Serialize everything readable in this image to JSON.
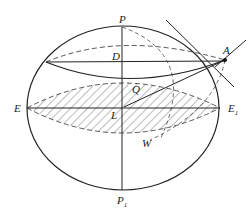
{
  "diagram": {
    "type": "geometry-sphere-section",
    "colors": {
      "stroke": "#222222",
      "hatch": "#555555",
      "background": "#ffffff"
    },
    "labels": {
      "P": "P",
      "P1_main": "P",
      "P1_sub": "1",
      "E": "E",
      "E1_main": "E",
      "E1_sub": "1",
      "A": "A",
      "D": "D",
      "Q": "Q",
      "L": "L",
      "W": "W"
    }
  }
}
